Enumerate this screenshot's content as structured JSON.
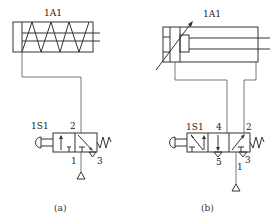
{
  "diagrams": [
    {
      "id": "a",
      "caption": "(a)",
      "cylinder": {
        "label": "1A1",
        "type": "single-acting spring-return cylinder"
      },
      "valve": {
        "label": "1S1",
        "type": "3/2 push-button valve, spring return",
        "ports": {
          "output": "2",
          "supply": "1",
          "exhaust": "3"
        }
      }
    },
    {
      "id": "b",
      "caption": "(b)",
      "cylinder": {
        "label": "1A1",
        "type": "double-acting cylinder with adjustable cushioning"
      },
      "valve": {
        "label": "1S1",
        "type": "5/2 push-button valve, spring return",
        "ports": {
          "out_a": "4",
          "out_b": "2",
          "exhaust_a": "5",
          "supply": "1",
          "exhaust_b": "3"
        }
      }
    }
  ],
  "colors": {
    "line": "#333333",
    "background": "#ffffff"
  }
}
